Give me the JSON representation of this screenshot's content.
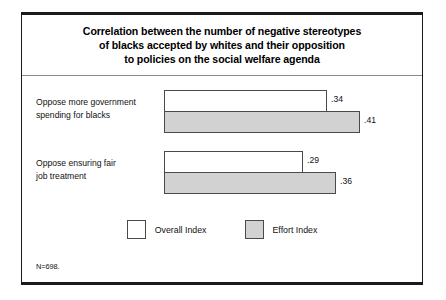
{
  "figure": {
    "title_lines": [
      "Correlation between the number of negative stereotypes",
      "of blacks accepted by whites and their opposition",
      "to policies on the social welfare agenda"
    ],
    "footnote": "N=698."
  },
  "legend": {
    "items": [
      {
        "label": "Overall Index",
        "color": "#ffffff",
        "swatch": "white-swatch"
      },
      {
        "label": "Effort Index",
        "color": "#d2d2d2",
        "swatch": "gray-swatch"
      }
    ]
  },
  "chart_data": {
    "type": "bar",
    "orientation": "horizontal",
    "title": "Correlation between the number of negative stereotypes of blacks accepted by whites and their opposition to policies on the social welfare agenda",
    "subtitle": "",
    "xlabel": "",
    "ylabel": "",
    "categories": [
      "Oppose more government spending for blacks",
      "Oppose ensuring fair job treatment"
    ],
    "category_label_lines": [
      [
        "Oppose more government",
        "spending for blacks"
      ],
      [
        "Oppose ensuring fair",
        "job treatment"
      ]
    ],
    "series": [
      {
        "name": "Overall Index",
        "color": "#ffffff",
        "values": [
          0.34,
          0.29
        ],
        "value_labels": [
          ".34",
          ".29"
        ]
      },
      {
        "name": "Effort Index",
        "color": "#d2d2d2",
        "values": [
          0.41,
          0.36
        ],
        "value_labels": [
          ".41",
          ".36"
        ]
      }
    ],
    "xlim": [
      0,
      0.5
    ],
    "grid": false,
    "legend_position": "bottom-center",
    "note": "N=698."
  }
}
